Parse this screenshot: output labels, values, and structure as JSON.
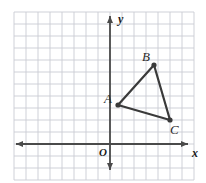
{
  "figure": {
    "type": "coordinate-plane-triangle",
    "background": "#ffffff",
    "grid": {
      "color": "#c9ccd4",
      "cell_px": 12,
      "left_px": 14,
      "top_px": 12,
      "right_px": 194,
      "bottom_px": 180,
      "cols": 15,
      "rows": 14
    },
    "axes": {
      "color": "#4a4a4a",
      "x_axis_y_px": 144,
      "y_axis_x_px": 110,
      "x_label": "x",
      "y_label": "y",
      "origin_label": "O"
    },
    "triangle": {
      "stroke": "#3a3a3a",
      "stroke_width": 2.2,
      "vertex_dot_color": "#3a3a3a",
      "vertex_dot_radius": 2.6,
      "vertices": [
        {
          "name": "A",
          "px": 118,
          "py": 105,
          "gx": 0.7,
          "gy": 3.3,
          "label": "A",
          "label_px": 104,
          "label_py": 92
        },
        {
          "name": "B",
          "px": 154,
          "py": 65,
          "gx": 3.7,
          "gy": 6.6,
          "label": "B",
          "label_px": 142,
          "label_py": 50
        },
        {
          "name": "C",
          "px": 170,
          "py": 120,
          "gx": 5.0,
          "gy": 2.0,
          "label": "C",
          "label_px": 170,
          "label_py": 123
        }
      ],
      "edges": [
        {
          "from": "A",
          "to": "B"
        },
        {
          "from": "B",
          "to": "C"
        },
        {
          "from": "C",
          "to": "A"
        }
      ]
    },
    "labels": {
      "y_label_px": 118,
      "y_label_py": 13,
      "x_label_px": 192,
      "x_label_py": 147,
      "o_label_px": 99,
      "o_label_py": 147
    }
  }
}
